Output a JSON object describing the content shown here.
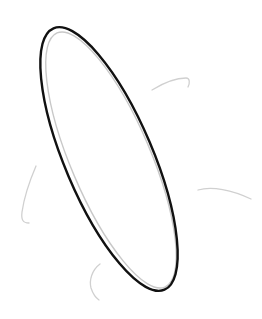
{
  "drawing": {
    "background": "#ffffff",
    "outline_color": "#111111",
    "inner_color": "#c8c8c8",
    "tendril_color": "#d0d0d0",
    "shape": "tilted-ellipse-sketch"
  }
}
